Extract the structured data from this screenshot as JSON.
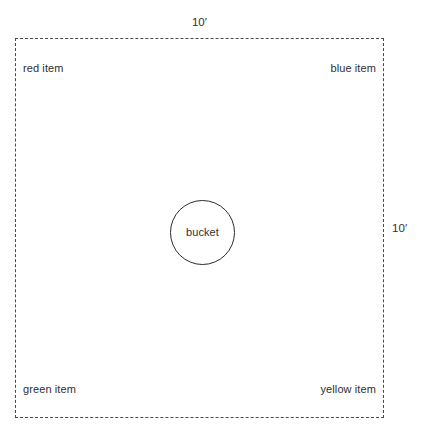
{
  "diagram": {
    "enclosure": {
      "shape": "dashed-square",
      "top_dimension": "10′",
      "right_dimension": "10′"
    },
    "center_object": {
      "label": "bucket",
      "shape": "circle"
    },
    "corner_items": {
      "top_left": "red item",
      "top_right": "blue item",
      "bottom_left": "green item",
      "bottom_right": "yellow item"
    },
    "colors": {
      "border": "#4a4a4a",
      "circle_stroke": "#2b2b2b",
      "text": "#2f2f2f",
      "background": "#ffffff"
    }
  }
}
